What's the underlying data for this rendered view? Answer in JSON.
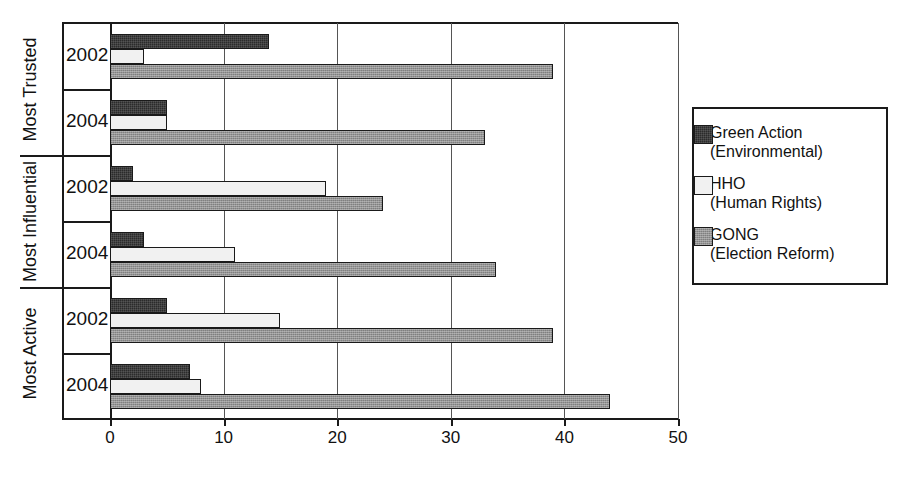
{
  "chart_data": {
    "type": "bar",
    "orientation": "horizontal",
    "title": "",
    "xlabel": "",
    "ylabel": "",
    "xlim": [
      0,
      50
    ],
    "xticks": [
      0,
      10,
      20,
      30,
      40,
      50
    ],
    "xtick_labels": [
      "0",
      "10",
      "20",
      "30",
      "40",
      "50"
    ],
    "grid": true,
    "grid_axis": "x",
    "legend_position": "right",
    "groups": [
      {
        "label": "Most Trusted",
        "years": [
          {
            "label": "2002",
            "values": [
              {
                "series": "Green Action",
                "value": 14
              },
              {
                "series": "HHO",
                "value": 3
              },
              {
                "series": "GONG",
                "value": 39
              }
            ]
          },
          {
            "label": "2004",
            "values": [
              {
                "series": "Green Action",
                "value": 5
              },
              {
                "series": "HHO",
                "value": 5
              },
              {
                "series": "GONG",
                "value": 33
              }
            ]
          }
        ]
      },
      {
        "label": "Most Influential",
        "years": [
          {
            "label": "2002",
            "values": [
              {
                "series": "Green Action",
                "value": 2
              },
              {
                "series": "HHO",
                "value": 19
              },
              {
                "series": "GONG",
                "value": 24
              }
            ]
          },
          {
            "label": "2004",
            "values": [
              {
                "series": "Green Action",
                "value": 3
              },
              {
                "series": "HHO",
                "value": 11
              },
              {
                "series": "GONG",
                "value": 34
              }
            ]
          }
        ]
      },
      {
        "label": "Most Active",
        "years": [
          {
            "label": "2002",
            "values": [
              {
                "series": "Green Action",
                "value": 5
              },
              {
                "series": "HHO",
                "value": 15
              },
              {
                "series": "GONG",
                "value": 39
              }
            ]
          },
          {
            "label": "2004",
            "values": [
              {
                "series": "Green Action",
                "value": 7
              },
              {
                "series": "HHO",
                "value": 8
              },
              {
                "series": "GONG",
                "value": 44
              }
            ]
          }
        ]
      }
    ],
    "series": [
      {
        "name": "Green Action",
        "detail": "(Environmental)",
        "fill": "dark",
        "color": "#2b2b2b",
        "values": [
          14,
          5,
          2,
          3,
          5,
          7
        ]
      },
      {
        "name": "HHO",
        "detail": "(Human Rights)",
        "fill": "light",
        "color": "#f1f1f1",
        "values": [
          3,
          5,
          19,
          11,
          15,
          8
        ]
      },
      {
        "name": "GONG",
        "detail": "(Election Reform)",
        "fill": "gray",
        "color": "#949494",
        "values": [
          39,
          33,
          24,
          34,
          39,
          44
        ]
      }
    ],
    "categories": [
      "Most Trusted 2002",
      "Most Trusted 2004",
      "Most Influential 2002",
      "Most Influential 2004",
      "Most Active 2002",
      "Most Active 2004"
    ]
  },
  "legend": {
    "entries": [
      {
        "name": "Green Action",
        "detail": "(Environmental)"
      },
      {
        "name": "HHO",
        "detail": "(Human Rights)"
      },
      {
        "name": "GONG",
        "detail": "(Election Reform)"
      }
    ]
  }
}
